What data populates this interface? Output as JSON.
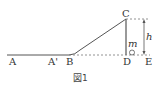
{
  "figure": {
    "caption": "図1",
    "points": {
      "A": "A",
      "A_prime": "A'",
      "B": "B",
      "C": "C",
      "D": "D",
      "E": "E"
    },
    "mass_label": "m",
    "height_label": "h",
    "colors": {
      "line": "#555555",
      "dashed": "#777777"
    }
  }
}
